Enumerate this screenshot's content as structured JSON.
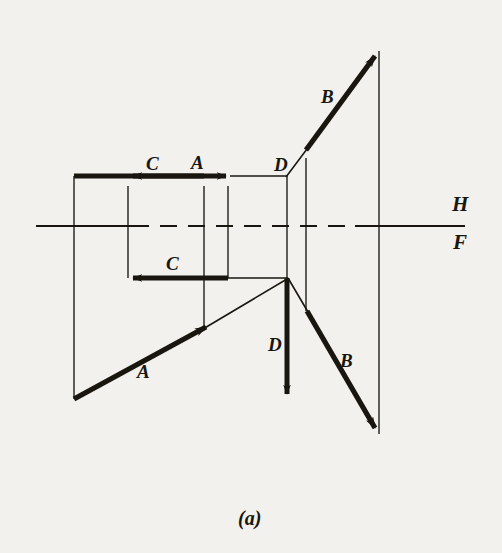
{
  "figure": {
    "caption": "(a)",
    "caption_pos": {
      "x": 238,
      "y": 508
    },
    "background_color": "#f3f1ed",
    "ink_color": "#18160f",
    "width": 502,
    "height": 553
  },
  "reference_line": {
    "name": "H-F folding line",
    "y": 226,
    "x_start": 36,
    "x_end": 465,
    "label_top": "H",
    "label_bottom": "F",
    "label_top_pos": {
      "x": 452,
      "y": 194
    },
    "label_bottom_pos": {
      "x": 453,
      "y": 232
    }
  },
  "vector_labels": [
    {
      "id": "C-top",
      "text": "C",
      "x": 146,
      "y": 154
    },
    {
      "id": "A-top",
      "text": "A",
      "x": 191,
      "y": 153
    },
    {
      "id": "D-top",
      "text": "D",
      "x": 274,
      "y": 155
    },
    {
      "id": "B-top",
      "text": "B",
      "x": 321,
      "y": 87
    },
    {
      "id": "C-front",
      "text": "C",
      "x": 166,
      "y": 254
    },
    {
      "id": "A-front",
      "text": "A",
      "x": 137,
      "y": 362
    },
    {
      "id": "D-front",
      "text": "D",
      "x": 268,
      "y": 335
    },
    {
      "id": "B-front",
      "text": "B",
      "x": 340,
      "y": 351
    }
  ],
  "geometry": {
    "top_view": {
      "name": "horizontal (top) view",
      "C_vector": {
        "x1": 204,
        "y1": 176,
        "x2": 128,
        "y2": 176,
        "thick": true,
        "arrow": "left"
      },
      "A_vector": {
        "x1": 74,
        "y1": 176,
        "x2": 230,
        "y2": 176,
        "thick": true,
        "arrow": "right"
      },
      "D_thin": {
        "x1": 230,
        "y1": 176,
        "x2": 287,
        "y2": 176,
        "thick": false
      },
      "D_leader": {
        "x1": 287,
        "y1": 176,
        "x2": 306,
        "y2": 150,
        "thick": false
      },
      "B_vector": {
        "x1": 306,
        "y1": 150,
        "x2": 379,
        "y2": 51,
        "thick": true,
        "arrow": "end"
      }
    },
    "front_view": {
      "name": "frontal (front) view",
      "C_vector": {
        "x1": 228,
        "y1": 278,
        "x2": 128,
        "y2": 278,
        "thick": true,
        "arrow": "left"
      },
      "C_thin": {
        "x1": 228,
        "y1": 278,
        "x2": 287,
        "y2": 278,
        "thick": false
      },
      "A_thin": {
        "x1": 287,
        "y1": 278,
        "x2": 205,
        "y2": 327,
        "thick": false
      },
      "A_vector": {
        "x1": 74,
        "y1": 399,
        "x2": 210,
        "y2": 324,
        "thick": true,
        "arrow": "end"
      },
      "D_vector": {
        "x1": 287,
        "y1": 278,
        "x2": 287,
        "y2": 399,
        "thick": true,
        "arrow": "down"
      },
      "B_thin": {
        "x1": 287,
        "y1": 278,
        "x2": 307,
        "y2": 311,
        "thick": false
      },
      "B_vector": {
        "x1": 307,
        "y1": 311,
        "x2": 379,
        "y2": 434,
        "thick": true,
        "arrow": "end"
      }
    },
    "projectors": [
      {
        "id": "projector-1",
        "x": 74,
        "y1": 176,
        "y2": 399
      },
      {
        "id": "projector-2",
        "x": 128,
        "y1": 186,
        "y2": 278
      },
      {
        "id": "projector-3",
        "x": 204,
        "y1": 186,
        "y2": 330
      },
      {
        "id": "projector-4",
        "x": 228,
        "y1": 186,
        "y2": 278
      },
      {
        "id": "projector-5",
        "x": 287,
        "y1": 176,
        "y2": 278
      },
      {
        "id": "projector-6",
        "x": 306,
        "y1": 158,
        "y2": 311
      },
      {
        "id": "projector-7",
        "x": 379,
        "y1": 51,
        "y2": 434
      }
    ]
  }
}
